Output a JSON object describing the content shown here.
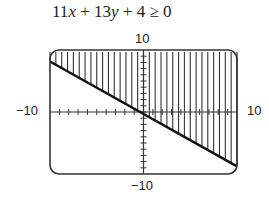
{
  "chart_data": {
    "type": "line",
    "title": "11x + 13y + 4 ≥ 0",
    "inequality": "11x + 13y + 4 >= 0",
    "boundary_line": {
      "slope": -0.846,
      "intercept": -0.308,
      "style": "solid"
    },
    "shaded_region": "above",
    "xlim": [
      -10,
      10
    ],
    "ylim": [
      -10,
      10
    ],
    "tick_labels": {
      "x_min": "−10",
      "x_max": "10",
      "y_min": "−10",
      "y_max": "10"
    },
    "xscale": 1,
    "yscale": 1,
    "grid": false,
    "legend": null
  },
  "labels": {
    "title_a": "11",
    "title_x": "x",
    "title_b": " + 13",
    "title_y": "y",
    "title_c": " + 4 ≥ 0",
    "y_max": "10",
    "y_min": "−10",
    "x_min": "−10",
    "x_max": "10"
  }
}
